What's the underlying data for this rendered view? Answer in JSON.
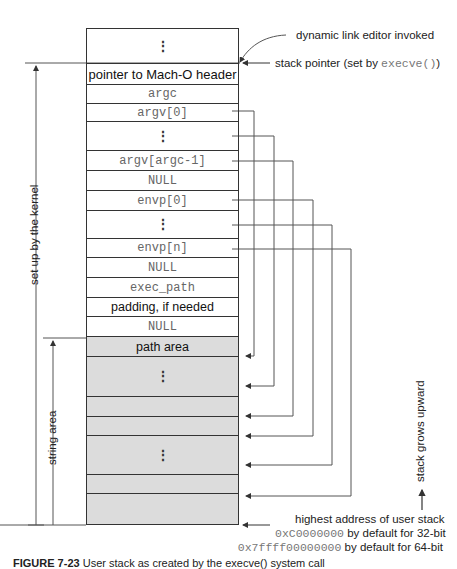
{
  "stack_cells": [
    {
      "label": "⋮",
      "kind": "dots"
    },
    {
      "label": "pointer to Mach-O header",
      "kind": "sans"
    },
    {
      "label": "argc",
      "kind": "mono"
    },
    {
      "label": "argv[0]",
      "kind": "mono"
    },
    {
      "label": "⋮",
      "kind": "dots"
    },
    {
      "label": "argv[argc-1]",
      "kind": "mono"
    },
    {
      "label": "NULL",
      "kind": "mono"
    },
    {
      "label": "envp[0]",
      "kind": "mono"
    },
    {
      "label": "⋮",
      "kind": "dots"
    },
    {
      "label": "envp[n]",
      "kind": "mono"
    },
    {
      "label": "NULL",
      "kind": "mono"
    },
    {
      "label": "exec_path",
      "kind": "mono"
    },
    {
      "label": "padding, if needed",
      "kind": "sans"
    },
    {
      "label": "NULL",
      "kind": "mono"
    }
  ],
  "string_area_cells": [
    {
      "label": "path area"
    },
    {
      "label": "⋮"
    },
    {
      "label": ""
    },
    {
      "label": ""
    },
    {
      "label": "⋮"
    },
    {
      "label": ""
    },
    {
      "label": ""
    }
  ],
  "annotations": {
    "dynamic_link_editor": "dynamic link editor invoked",
    "stack_pointer_prefix": "stack pointer (set by ",
    "stack_pointer_code": "execve()",
    "stack_pointer_suffix": ")",
    "set_up_by_kernel": "set up by the kernel",
    "string_area": "string area",
    "stack_grows": "stack grows upward",
    "highest_address": "highest address of user stack",
    "addr32_code": "0xC0000000",
    "addr32_text": " by default for 32-bit",
    "addr64_code": "0x7ffff00000000",
    "addr64_text": " by default for 64-bit"
  },
  "caption": {
    "figure": "FIGURE 7-23",
    "text": "User stack as created by the execve() system call"
  }
}
